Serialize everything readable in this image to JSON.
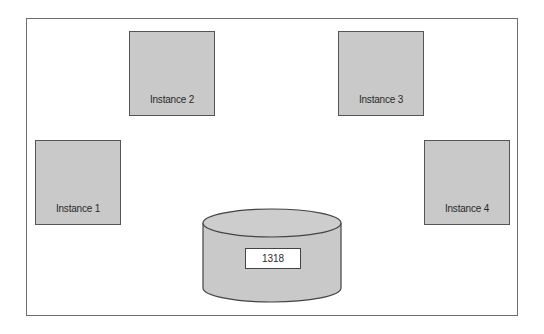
{
  "diagram": {
    "instances": [
      {
        "id": 1,
        "label": "Instance 1"
      },
      {
        "id": 2,
        "label": "Instance 2"
      },
      {
        "id": 3,
        "label": "Instance 3"
      },
      {
        "id": 4,
        "label": "Instance 4"
      }
    ],
    "database": {
      "label": "1318"
    },
    "colors": {
      "box_fill": "#c9c9c9",
      "border": "#555555",
      "background": "#ffffff"
    }
  }
}
